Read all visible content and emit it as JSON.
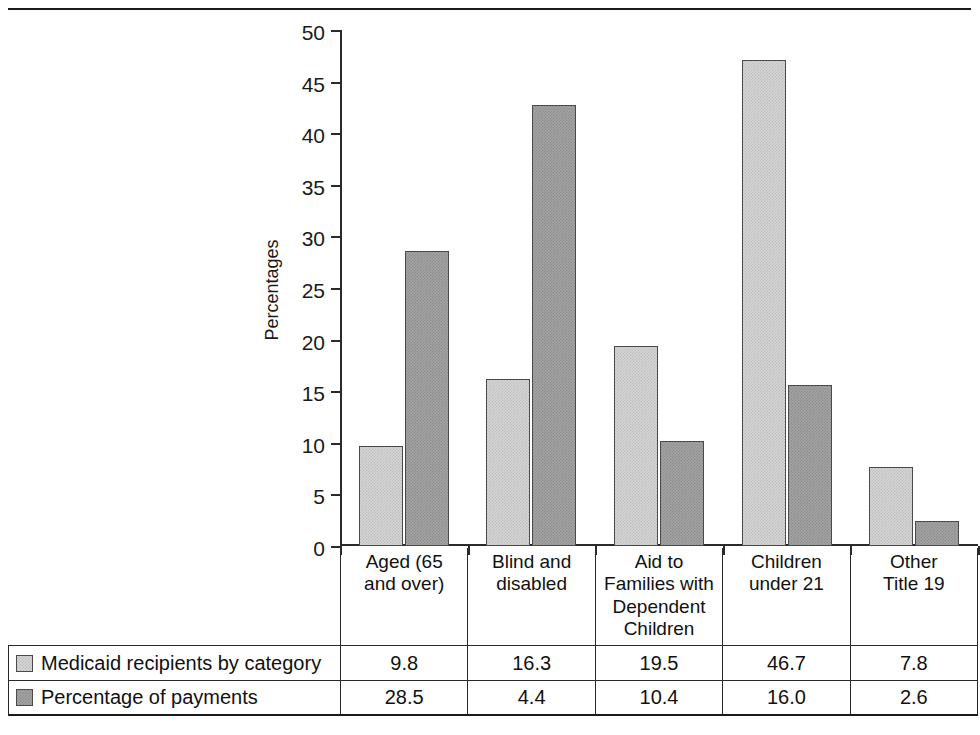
{
  "chart_data": {
    "type": "bar",
    "title": "",
    "xlabel": "",
    "ylabel": "Percentages",
    "ylim": [
      0,
      50
    ],
    "ytick_labels": [
      "50",
      "45",
      "40",
      "35",
      "30",
      "25",
      "20",
      "15",
      "10",
      "5",
      "0"
    ],
    "yticks": [
      50,
      45,
      40,
      35,
      30,
      25,
      20,
      15,
      10,
      5,
      0
    ],
    "grid": false,
    "legend_position": "bottom-table",
    "categories": [
      "Aged (65 and over)",
      "Blind and disabled",
      "Aid to Families with Dependent Children",
      "Children under 21",
      "Other Title 19"
    ],
    "category_lines": [
      [
        "Aged (65",
        "and over)"
      ],
      [
        "Blind and",
        "disabled"
      ],
      [
        "Aid to",
        "Families with",
        "Dependent",
        "Children"
      ],
      [
        "Children",
        "under 21"
      ],
      [
        "Other",
        "Title 19"
      ]
    ],
    "series": [
      {
        "name": "Medicaid recipients by category",
        "color": "#d5d5d5",
        "table_values": [
          "9.8",
          "16.3",
          "19.5",
          "46.7",
          "7.8"
        ],
        "values": [
          9.8,
          16.3,
          19.5,
          46.7,
          7.8
        ],
        "plotted_values": [
          9.7,
          16.2,
          19.4,
          47.1,
          7.7
        ]
      },
      {
        "name": "Percentage of payments",
        "color": "#a3a3a3",
        "table_values": [
          "28.5",
          "4.4",
          "10.4",
          "16.0",
          "2.6"
        ],
        "values": [
          28.5,
          4.4,
          10.4,
          16.0,
          2.6
        ],
        "plotted_values": [
          28.6,
          42.7,
          10.2,
          15.6,
          2.4
        ]
      }
    ]
  },
  "colors": {
    "series_light": "#d5d5d5",
    "series_dark": "#a3a3a3",
    "axis": "#2a2a2a",
    "text": "#111111",
    "rule": "#1a1a1a"
  }
}
